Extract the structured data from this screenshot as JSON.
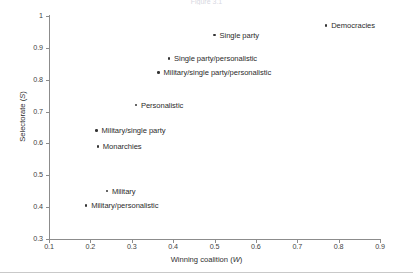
{
  "figure": {
    "top_caption": "Figure 3.1",
    "background_color": "#ffffff",
    "axis_color": "#8c8c8c",
    "marker_color": "#343434",
    "text_color": "#2b2b2b"
  },
  "chart_data": {
    "type": "scatter",
    "title": "",
    "xlabel": "Winning coalition (W)",
    "xlabel_text": "Winning coalition (",
    "xlabel_var": "W",
    "xlabel_tail": ")",
    "ylabel": "Selectorate (S)",
    "ylabel_text": "Selectorate (",
    "ylabel_var": "S",
    "ylabel_tail": ")",
    "xlim": [
      0.1,
      0.9
    ],
    "ylim": [
      0.3,
      1.0
    ],
    "grid": false,
    "legend": "none",
    "xticks": [
      "0.1",
      "0.2",
      "0.3",
      "0.4",
      "0.5",
      "0.6",
      "0.7",
      "0.8",
      "0.9"
    ],
    "xtick_values": [
      0.1,
      0.2,
      0.3,
      0.4,
      0.5,
      0.6,
      0.7,
      0.8,
      0.9
    ],
    "yticks": [
      "0.3",
      "0.4",
      "0.5",
      "0.6",
      "0.7",
      "0.8",
      "0.9",
      "1"
    ],
    "ytick_values": [
      0.3,
      0.4,
      0.5,
      0.6,
      0.7,
      0.8,
      0.9,
      1.0
    ],
    "points": [
      {
        "label": "Democracies",
        "x": 0.77,
        "y": 0.97
      },
      {
        "label": "Single party",
        "x": 0.5,
        "y": 0.94
      },
      {
        "label": "Single party/personalistic",
        "x": 0.39,
        "y": 0.866
      },
      {
        "label": "Military/single party/personalistic",
        "x": 0.365,
        "y": 0.822
      },
      {
        "label": "Personalistic",
        "x": 0.31,
        "y": 0.72
      },
      {
        "label": "Military/single party",
        "x": 0.215,
        "y": 0.64
      },
      {
        "label": "Monarchies",
        "x": 0.218,
        "y": 0.59
      },
      {
        "label": "Military",
        "x": 0.24,
        "y": 0.45
      },
      {
        "label": "Military/personalistic",
        "x": 0.19,
        "y": 0.405
      }
    ]
  }
}
